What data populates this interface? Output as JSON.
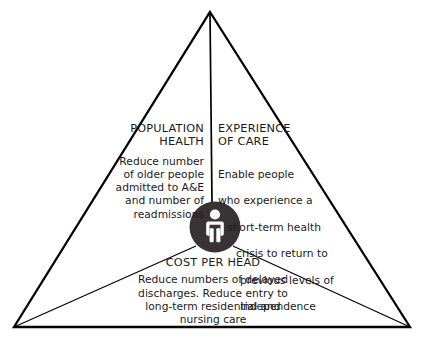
{
  "diagram": {
    "type": "triangle-framework",
    "shape_name": "triple-aim-triangle",
    "background_color": "#ffffff",
    "line_color": "#000000",
    "center_circle_color": "#3a3335",
    "center_icon_color": "#ffffff",
    "center_icon": "person-icon",
    "zones": [
      {
        "id": "population-health",
        "title": "POPULATION\nHEALTH",
        "body": "Reduce number\nof older people\nadmitted to A&E\nand number of\nreadmissions",
        "body_lines": [
          "Reduce number",
          "of older people",
          "admitted to A&E",
          "and number of",
          "readmissions"
        ],
        "align": "right"
      },
      {
        "id": "experience-of-care",
        "title": "EXPERIENCE\nOF CARE",
        "body": "Enable people\nwho experience a\nshort-term health\ncrisis to return to\nprevious levels of\nindependence",
        "body_lines": [
          "Enable people",
          "who experience a",
          "short-term health",
          "crisis to return to",
          "previous levels of",
          "independence"
        ],
        "align": "left"
      },
      {
        "id": "cost-per-head",
        "title": "COST PER HEAD",
        "body": "Reduce numbers of delayed\ndischarges. Reduce entry to\nlong-term residential and\nnursing care",
        "body_lines": [
          "Reduce numbers of delayed",
          "discharges. Reduce entry to",
          "long-term residential and",
          "nursing care"
        ],
        "align": "center"
      }
    ]
  }
}
